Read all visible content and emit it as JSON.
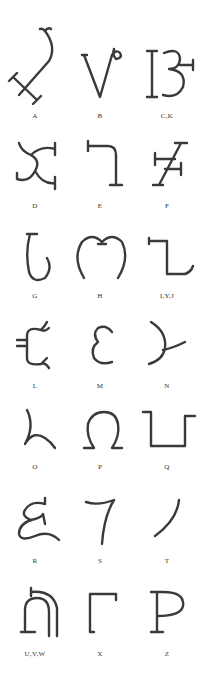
{
  "glyphs": [
    {
      "label": "A",
      "icon": "glyph-a"
    },
    {
      "label": "B",
      "icon": "glyph-b"
    },
    {
      "label": "C,K",
      "icon": "glyph-c-k"
    },
    {
      "label": "D",
      "icon": "glyph-d"
    },
    {
      "label": "E",
      "icon": "glyph-e"
    },
    {
      "label": "F",
      "icon": "glyph-f"
    },
    {
      "label": "G",
      "icon": "glyph-g"
    },
    {
      "label": "H",
      "icon": "glyph-h"
    },
    {
      "label": "I,Y,J",
      "icon": "glyph-i-y-j"
    },
    {
      "label": "L",
      "icon": "glyph-l"
    },
    {
      "label": "M",
      "icon": "glyph-m"
    },
    {
      "label": "N",
      "icon": "glyph-n"
    },
    {
      "label": "O",
      "icon": "glyph-o"
    },
    {
      "label": "P",
      "icon": "glyph-p"
    },
    {
      "label": "Q",
      "icon": "glyph-q"
    },
    {
      "label": "R",
      "icon": "glyph-r"
    },
    {
      "label": "S",
      "icon": "glyph-s"
    },
    {
      "label": "T",
      "icon": "glyph-t"
    },
    {
      "label": "U,V,W",
      "icon": "glyph-u-v-w"
    },
    {
      "label": "X",
      "icon": "glyph-x"
    },
    {
      "label": "Z",
      "icon": "glyph-z"
    }
  ]
}
